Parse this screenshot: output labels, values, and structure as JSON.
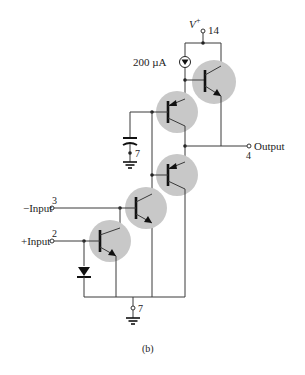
{
  "figure": {
    "caption": "(b)",
    "supply": {
      "label": "V",
      "superscript": "+",
      "pin": "14"
    },
    "current_source": {
      "label": "200 µA"
    },
    "output": {
      "label": "Output",
      "pin": "4"
    },
    "inputs": [
      {
        "label": "−Input",
        "pin": "3"
      },
      {
        "label": "+Input",
        "pin": "2"
      }
    ],
    "grounds": [
      {
        "pin": "7",
        "position": "capacitor"
      },
      {
        "pin": "7",
        "position": "bottom"
      }
    ],
    "components": {
      "transistors": [
        {
          "name": "output-npn",
          "type": "npn"
        },
        {
          "name": "upper-pnp",
          "type": "pnp"
        },
        {
          "name": "lower-pnp",
          "type": "pnp"
        },
        {
          "name": "middle-npn",
          "type": "npn"
        },
        {
          "name": "input-npn",
          "type": "npn"
        }
      ],
      "capacitor": {
        "name": "compensation-capacitor"
      },
      "diode": {
        "name": "input-diode"
      }
    },
    "colors": {
      "transistor_bubble": "#c8c8c8",
      "wire": "#3a3a3a"
    }
  }
}
